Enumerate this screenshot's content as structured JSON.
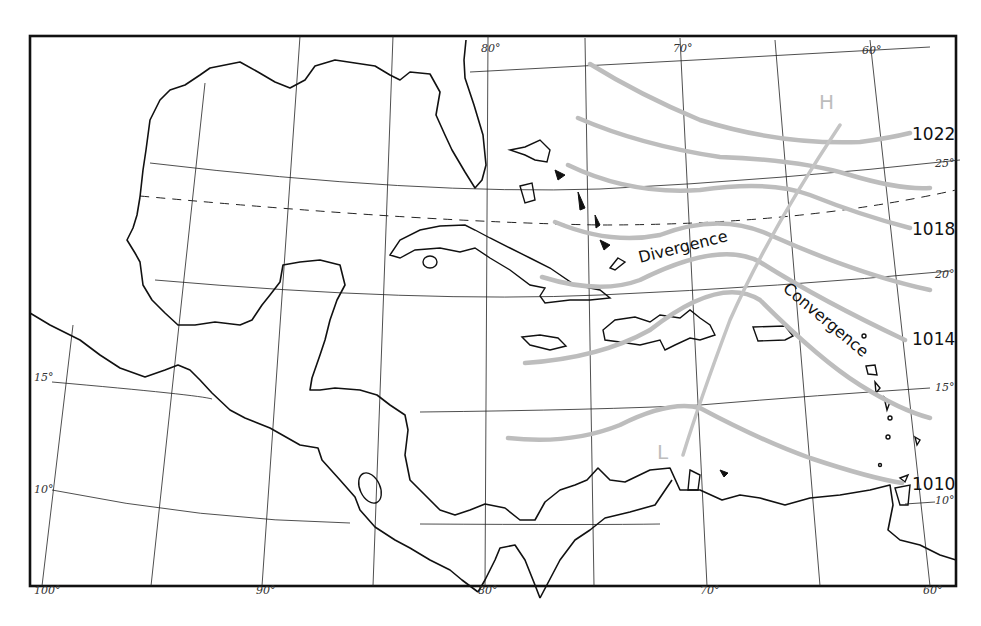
{
  "map": {
    "title": "",
    "colors": {
      "coastline": "#111111",
      "isobar": "#bdbdbd",
      "grid": "#222222",
      "background": "#ffffff"
    },
    "longitude_labels": {
      "top": [
        "80°",
        "70°",
        "60°"
      ],
      "bottom": [
        "100°",
        "90°",
        "80°",
        "70°",
        "60°"
      ]
    },
    "latitude_labels": {
      "left": [
        "15°",
        "10°"
      ],
      "right": [
        "25°",
        "20°",
        "15°",
        "10°"
      ]
    },
    "isobars": [
      {
        "label": "1022"
      },
      {
        "label": "1018"
      },
      {
        "label": "1014"
      },
      {
        "label": "1010"
      }
    ],
    "pressure_centers": {
      "high": "H",
      "low": "L"
    },
    "annotations": {
      "divergence": "Divergence",
      "convergence": "Convergence"
    }
  }
}
